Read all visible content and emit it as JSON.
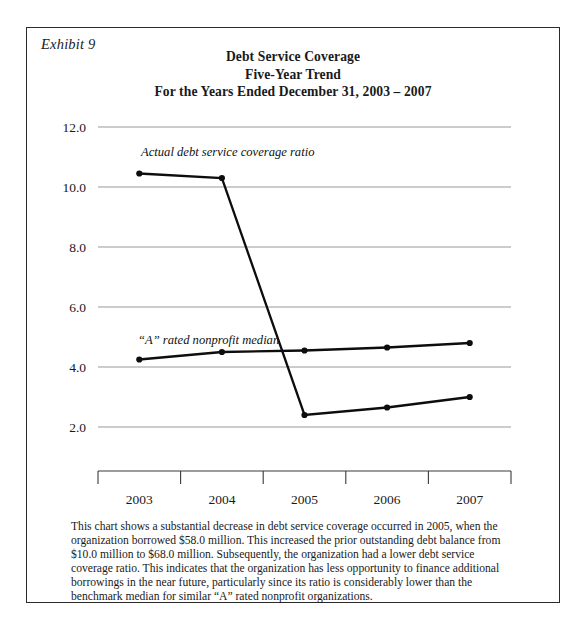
{
  "exhibit": {
    "label": "Exhibit 9"
  },
  "chart_data": {
    "type": "line",
    "title": "Debt Service Coverage",
    "subtitle": "Five-Year Trend",
    "subtitle2": "For the Years Ended December 31, 2003 – 2007",
    "title_lines": [
      "Debt Service Coverage",
      "Five-Year Trend",
      "For the Years Ended December 31, 2003 – 2007"
    ],
    "xlabel": "",
    "ylabel": "",
    "categories": [
      "2003",
      "2004",
      "2005",
      "2006",
      "2007"
    ],
    "ylim": [
      0.0,
      12.0
    ],
    "ytick_labels": [
      "12.0",
      "10.0",
      "8.0",
      "6.0",
      "4.0",
      "2.0"
    ],
    "ytick_values": [
      12.0,
      10.0,
      8.0,
      6.0,
      4.0,
      2.0
    ],
    "grid": true,
    "legend": "inline-annotations",
    "series": [
      {
        "name": "Actual debt service coverage ratio",
        "values": [
          10.45,
          10.3,
          2.4,
          2.65,
          3.0
        ]
      },
      {
        "name": "“A” rated nonprofit median",
        "values": [
          4.25,
          4.5,
          4.55,
          4.65,
          4.8
        ]
      }
    ],
    "annotations": [
      {
        "text": "Actual debt service coverage ratio",
        "series": "Actual debt service coverage ratio"
      },
      {
        "text": "“A” rated nonprofit median",
        "series": "“A” rated nonprofit median"
      }
    ],
    "colors": {
      "line": "#0d0d0d",
      "grid": "#9a9a9a",
      "axis": "#3a3a3a"
    }
  },
  "caption": {
    "text": "This chart shows a substantial decrease in debt service coverage occurred in 2005, when the organization borrowed $58.0 million. This increased the prior outstanding debt balance from $10.0 million to $68.0 million. Subsequently, the organization had a lower debt service coverage ratio. This indicates that the organization has less opportunity to finance additional borrowings in the near future, particularly since its ratio is considerably lower than the benchmark median for similar “A” rated nonprofit organizations."
  }
}
